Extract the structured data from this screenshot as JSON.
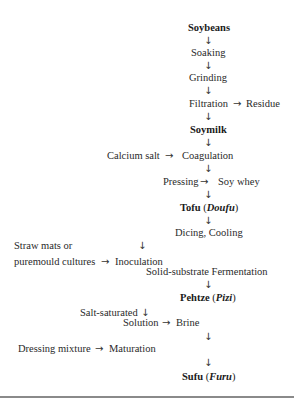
{
  "flowchart": {
    "title": "Sufu production process",
    "nodes": {
      "soybeans": "Soybeans",
      "soaking": "Soaking",
      "grinding": "Grinding",
      "filtration": "Filtration",
      "residue": "Residue",
      "soymilk": "Soymilk",
      "calcium_salt": "Calcium salt",
      "coagulation": "Coagulation",
      "pressing": "Pressing",
      "soy_whey": "Soy whey",
      "tofu": "Tofu",
      "tofu_alt": "Doufu",
      "dicing_cooling": "Dicing, Cooling",
      "straw_mats_line1": "Straw mats or",
      "straw_mats_line2": "puremould cultures",
      "inoculation": "Inoculation",
      "fermentation": "Solid-substrate Fermentation",
      "pehtze": "Pehtze",
      "pehtze_alt": "Pizi",
      "salt_saturated": "Salt-saturated",
      "solution": "Solution",
      "brine": "Brine",
      "dressing_mixture": "Dressing mixture",
      "maturation": "Maturation",
      "sufu": "Sufu",
      "sufu_alt": "Furu"
    },
    "symbols": {
      "down_arrow": "↓",
      "right_arrow": "→",
      "open_paren": "(",
      "close_paren": ")"
    }
  }
}
